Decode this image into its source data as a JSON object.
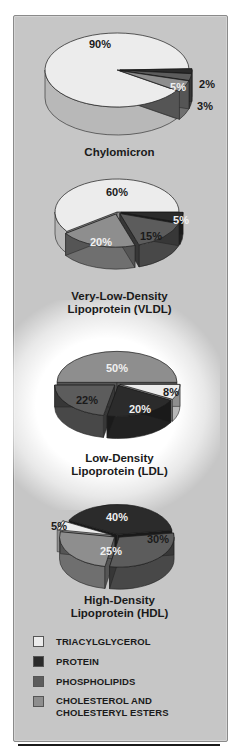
{
  "colors": {
    "triacylglycerol": "#ececec",
    "protein": "#2b2b2b",
    "phospholipids": "#5c5c5c",
    "cholesterol": "#8e8e8e",
    "panel_bg": "#c6c6c6"
  },
  "chart_data": [
    {
      "type": "pie",
      "title": "Chylomicron",
      "categories": [
        "Triacylglycerol",
        "Protein",
        "Phospholipids",
        "Cholesterol and Cholesteryl Esters"
      ],
      "values": [
        90,
        2,
        3,
        5
      ],
      "labels": [
        "90%",
        "2%",
        "3%",
        "5%"
      ]
    },
    {
      "type": "pie",
      "title": "Very-Low-Density Lipoprotein (VLDL)",
      "categories": [
        "Triacylglycerol",
        "Protein",
        "Phospholipids",
        "Cholesterol and Cholesteryl Esters"
      ],
      "values": [
        60,
        5,
        15,
        20
      ],
      "labels": [
        "60%",
        "5%",
        "15%",
        "20%"
      ]
    },
    {
      "type": "pie",
      "title": "Low-Density Lipoprotein (LDL)",
      "categories": [
        "Triacylglycerol",
        "Protein",
        "Phospholipids",
        "Cholesterol and Cholesteryl Esters"
      ],
      "values": [
        8,
        20,
        22,
        50
      ],
      "labels": [
        "8%",
        "20%",
        "22%",
        "50%"
      ]
    },
    {
      "type": "pie",
      "title": "High-Density Lipoprotein (HDL)",
      "categories": [
        "Triacylglycerol",
        "Protein",
        "Phospholipids",
        "Cholesterol and Cholesteryl Esters"
      ],
      "values": [
        5,
        40,
        30,
        25
      ],
      "labels": [
        "5%",
        "40%",
        "30%",
        "25%"
      ]
    }
  ],
  "titles": {
    "chylomicron": "Chylomicron",
    "vldl_line1": "Very-Low-Density",
    "vldl_line2": "Lipoprotein (VLDL)",
    "ldl_line1": "Low-Density",
    "ldl_line2": "Lipoprotein (LDL)",
    "hdl_line1": "High-Density",
    "hdl_line2": "Lipoprotein (HDL)"
  },
  "legend": {
    "items": [
      {
        "label": "TRIACYLGLYCEROL",
        "key": "triacylglycerol"
      },
      {
        "label": "PROTEIN",
        "key": "protein"
      },
      {
        "label": "PHOSPHOLIPIDS",
        "key": "phospholipids"
      },
      {
        "label_line1": "CHOLESTEROL  AND",
        "label_line2": "CHOLESTERYL ESTERS",
        "key": "cholesterol"
      }
    ]
  }
}
